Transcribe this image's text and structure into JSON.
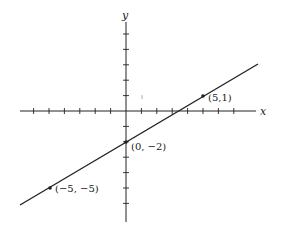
{
  "chart_data": {
    "type": "line",
    "title": "",
    "xlabel": "x",
    "ylabel": "y",
    "xlim": [
      -7,
      8.5
    ],
    "ylim": [
      -7,
      6.5
    ],
    "x_ticks": [
      -6,
      -5,
      -4,
      -3,
      -2,
      -1,
      1,
      2,
      3,
      4,
      5,
      6,
      7
    ],
    "y_ticks": [
      -6,
      -5,
      -4,
      -3,
      -2,
      -1,
      1,
      2,
      3,
      4,
      5
    ],
    "grid": false,
    "legend": null,
    "series": [
      {
        "name": "line",
        "equation": "y = (3/5)x - 2",
        "x": [
          -7,
          8.5
        ],
        "y": [
          -6.2,
          3.1
        ]
      }
    ],
    "points": [
      {
        "x": -5,
        "y": -5,
        "label": "(−5, −5)"
      },
      {
        "x": 0,
        "y": -2,
        "label": "(0, −2)"
      },
      {
        "x": 5,
        "y": 1,
        "label": "(5,1)"
      }
    ],
    "annotations": [
      "(−5, −5)",
      "(0, −2)",
      "(5,1)"
    ]
  },
  "axes": {
    "x_label": "x",
    "y_label": "y"
  },
  "labels": {
    "p1": "(−5, −5)",
    "p2": "(0, −2)",
    "p3": "(5,1)"
  },
  "colors": {
    "ink": "#222222",
    "background": "#ffffff"
  }
}
